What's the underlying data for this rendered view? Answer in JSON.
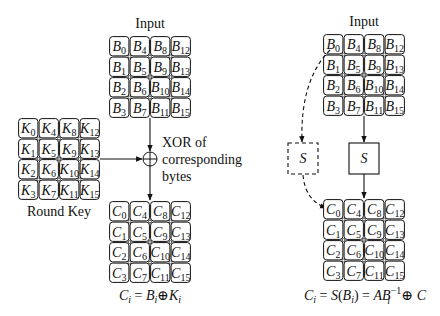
{
  "diagram": {
    "left": {
      "input_label": "Input",
      "input_grid": {
        "letter": "B",
        "rows": [
          [
            "0",
            "4",
            "8",
            "12"
          ],
          [
            "1",
            "5",
            "9",
            "13"
          ],
          [
            "2",
            "6",
            "10",
            "14"
          ],
          [
            "3",
            "7",
            "11",
            "15"
          ]
        ]
      },
      "key_label": "Round Key",
      "key_grid": {
        "letter": "K",
        "rows": [
          [
            "0",
            "4",
            "8",
            "12"
          ],
          [
            "1",
            "5",
            "9",
            "13"
          ],
          [
            "2",
            "6",
            "10",
            "14"
          ],
          [
            "3",
            "7",
            "11",
            "15"
          ]
        ]
      },
      "xor_symbol": "⊕",
      "xor_label_lines": [
        "XOR of",
        "corresponding",
        "bytes"
      ],
      "output_grid": {
        "letter": "C",
        "rows": [
          [
            "0",
            "4",
            "8",
            "12"
          ],
          [
            "1",
            "5",
            "9",
            "13"
          ],
          [
            "2",
            "6",
            "10",
            "14"
          ],
          [
            "3",
            "7",
            "11",
            "15"
          ]
        ]
      },
      "formula": {
        "lhs": "C",
        "lhs_sub": "i",
        "eq": " = ",
        "a": "B",
        "a_sub": "i",
        "op": "⊕",
        "b": "K",
        "b_sub": "i"
      }
    },
    "right": {
      "input_label": "Input",
      "input_grid": {
        "letter": "B",
        "rows": [
          [
            "0",
            "4",
            "8",
            "12"
          ],
          [
            "1",
            "5",
            "9",
            "13"
          ],
          [
            "2",
            "6",
            "10",
            "14"
          ],
          [
            "3",
            "7",
            "11",
            "15"
          ]
        ]
      },
      "sbox_label": "S",
      "sbox_dashed_label": "S",
      "output_grid": {
        "letter": "C",
        "rows": [
          [
            "0",
            "4",
            "8",
            "12"
          ],
          [
            "1",
            "5",
            "9",
            "13"
          ],
          [
            "2",
            "6",
            "10",
            "14"
          ],
          [
            "3",
            "7",
            "11",
            "15"
          ]
        ]
      },
      "formula": {
        "lhs": "C",
        "lhs_sub": "i",
        "eq1": " = ",
        "s": "S",
        "open": "(",
        "b": "B",
        "b_sub": "i",
        "close": ")",
        "eq2": " = ",
        "a": "A",
        "b2": "B",
        "b2_sub": "i",
        "b2_sup": "−1",
        "op": " ⊕ ",
        "c": "C"
      }
    },
    "colors": {
      "line": "#111111",
      "background": "#ffffff"
    }
  }
}
